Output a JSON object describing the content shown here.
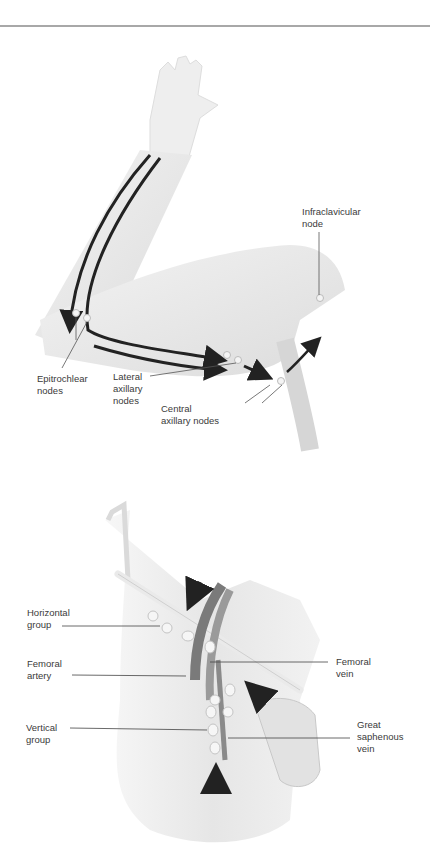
{
  "header": {
    "rule_color": "#a8a8a8"
  },
  "arm_figure": {
    "labels": {
      "infraclavicular": "Infraclavicular\nnode",
      "epitrochlear": "Epitrochlear\nnodes",
      "lateral_axillary": "Lateral\naxillary\nnodes",
      "central_axillary": "Central\naxillary nodes"
    }
  },
  "inguinal_figure": {
    "labels": {
      "horizontal_group": "Horizontal\ngroup",
      "femoral_artery": "Femoral\nartery",
      "vertical_group": "Vertical\ngroup",
      "femoral_vein": "Femoral\nvein",
      "great_saphenous_vein": "Great\nsaphenous\nvein"
    }
  },
  "colors": {
    "skin": "#ececec",
    "skin_shade": "#d9d9d9",
    "arrow": "#222222",
    "node": "#f4f4f4",
    "vessel": "#8a8a8a"
  }
}
